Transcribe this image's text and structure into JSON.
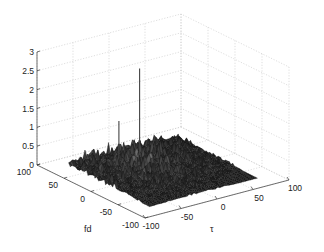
{
  "chart_data": {
    "type": "surface3d",
    "title": "",
    "xlabel": "τ",
    "ylabel": "fd",
    "zlabel": "",
    "xlim": [
      -100,
      100
    ],
    "ylim": [
      -100,
      100
    ],
    "zlim": [
      0,
      3
    ],
    "x_ticks": [
      "-100",
      "-50",
      "0",
      "50",
      "100"
    ],
    "y_ticks": [
      "100",
      "50",
      "0",
      "-50",
      "-100"
    ],
    "z_ticks": [
      "0",
      "0.5",
      "1",
      "1.5",
      "2",
      "2.5",
      "3"
    ],
    "grid": true,
    "colormap": "gray",
    "surface_extent": {
      "tau": [
        -75,
        75
      ],
      "fd": [
        -75,
        75
      ]
    },
    "noise_floor_peak_height": 0.55,
    "peaks": [
      {
        "tau": -10,
        "fd": 30,
        "height": 2.6,
        "label": "main peak"
      },
      {
        "tau": -35,
        "fd": 35,
        "height": 1.3,
        "label": "secondary peak"
      }
    ]
  }
}
